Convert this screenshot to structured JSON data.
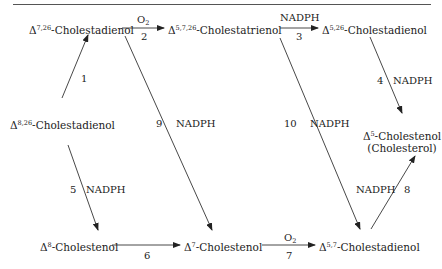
{
  "diagram": {
    "title": "",
    "nodes": {
      "n1": {
        "delta": "Δ",
        "sup": "7,26",
        "name": "-Cholestadienol"
      },
      "n2": {
        "delta": "Δ",
        "sup": "5,7,26",
        "name": "-Cholestatrienol"
      },
      "n3": {
        "delta": "Δ",
        "sup": "5,26",
        "name": "-Cholestadienol"
      },
      "n4": {
        "delta": "Δ",
        "sup": "8,26",
        "name": "-Cholestadienol"
      },
      "n5": {
        "delta": "Δ",
        "sup": "5",
        "name": "-Cholestenol",
        "subtitle": "(Cholesterol)"
      },
      "n6": {
        "delta": "Δ",
        "sup": "8",
        "name": "-Cholestenol"
      },
      "n7": {
        "delta": "Δ",
        "sup": "7",
        "name": "-Cholestenol"
      },
      "n8": {
        "delta": "Δ",
        "sup": "5,7",
        "name": "-Cholestadienol"
      }
    },
    "edges": [
      {
        "id": "1",
        "from": "n4",
        "to": "n1",
        "cofactor": ""
      },
      {
        "id": "2",
        "from": "n1",
        "to": "n2",
        "cofactor": "O",
        "cofactor_sub": "2"
      },
      {
        "id": "3",
        "from": "n2",
        "to": "n3",
        "cofactor": "NADPH"
      },
      {
        "id": "4",
        "from": "n3",
        "to": "n5",
        "cofactor": "NADPH"
      },
      {
        "id": "5",
        "from": "n4",
        "to": "n6",
        "cofactor": "NADPH"
      },
      {
        "id": "6",
        "from": "n6",
        "to": "n7",
        "cofactor": ""
      },
      {
        "id": "7",
        "from": "n7",
        "to": "n8",
        "cofactor": "O",
        "cofactor_sub": "2"
      },
      {
        "id": "8",
        "from": "n8",
        "to": "n5",
        "cofactor": "NADPH"
      },
      {
        "id": "9",
        "from": "n1",
        "to": "n7",
        "cofactor": "NADPH"
      },
      {
        "id": "10",
        "from": "n2",
        "to": "n8",
        "cofactor": "NADPH"
      }
    ]
  }
}
